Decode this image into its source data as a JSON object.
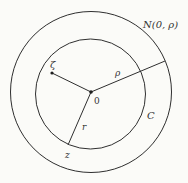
{
  "diagram": {
    "outer_circle_label": "N(0, ρ)",
    "inner_circle_label": "C",
    "center_label": "0",
    "point_zeta_label": "ζ",
    "point_z_label": "z",
    "radius_rho_label": "ρ",
    "radius_r_label": "r",
    "colors": {
      "stroke": "#2f2f2f",
      "background": "#fbfbf8"
    }
  }
}
